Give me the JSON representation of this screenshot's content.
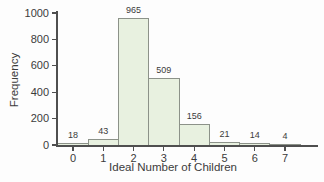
{
  "chart_data": {
    "type": "bar",
    "subtype": "histogram",
    "title": "",
    "xlabel": "Ideal Number of Children",
    "ylabel": "Frequency",
    "categories": [
      "0",
      "1",
      "2",
      "3",
      "4",
      "5",
      "6",
      "7"
    ],
    "values": [
      18,
      43,
      965,
      509,
      156,
      21,
      14,
      4
    ],
    "yticks": [
      0,
      200,
      400,
      600,
      800,
      1000
    ],
    "ylim": [
      0,
      1000
    ],
    "grid": false,
    "legend": "none",
    "bar_gap": 0,
    "bar_value_labels_shown": true
  },
  "colors": {
    "bar_fill": "#e8f1e0",
    "bar_border": "#8c9289",
    "axis": "#4f4f4f",
    "text": "#3b3b3b",
    "background": "#fdfdfd"
  }
}
